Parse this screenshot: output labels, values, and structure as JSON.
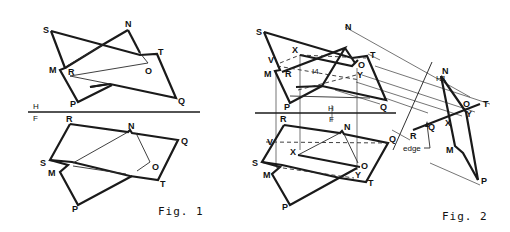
{
  "figures": {
    "fig1": {
      "caption": "Fig. 1",
      "fold_line": {
        "upper": "H",
        "lower": "F"
      },
      "top_view": {
        "labels": {
          "S": "S",
          "N": "N",
          "T": "T",
          "M": "M",
          "R": "R",
          "O": "O",
          "P": "P",
          "Q": "Q"
        }
      },
      "front_view": {
        "labels": {
          "R": "R",
          "N": "N",
          "Q": "Q",
          "S": "S",
          "M": "M",
          "O": "O",
          "T": "T",
          "P": "P"
        }
      }
    },
    "fig2": {
      "caption": "Fig. 2",
      "fold_line": {
        "upper": "H",
        "lower": "F"
      },
      "aux_fold": "H1",
      "top_view": {
        "labels": {
          "S": "S",
          "N": "N",
          "X": "X",
          "T": "T",
          "V": "V",
          "O": "O",
          "M": "M",
          "R": "R",
          "I4": "I4",
          "Y": "Y",
          "P": "P",
          "Q": "Q"
        }
      },
      "front_view": {
        "labels": {
          "R": "R",
          "N": "N",
          "Q": "Q",
          "V": "V",
          "X": "X",
          "S": "S",
          "O": "O",
          "M": "M",
          "Y": "Y",
          "T": "T",
          "P": "P"
        }
      },
      "aux_view": {
        "labels": {
          "N": "N",
          "O": "O",
          "T": "T",
          "Y": "Y",
          "X": "X",
          "Q": "Q",
          "R": "R",
          "M": "M",
          "P": "P"
        },
        "annotation": "edge"
      }
    }
  }
}
